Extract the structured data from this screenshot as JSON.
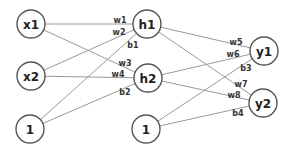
{
  "diagram": {
    "type": "neural-network",
    "colors": {
      "edge": "#9a9a9a",
      "node_stroke": "#555555",
      "text": "#222222",
      "background": "#ffffff"
    },
    "node_radius": 14,
    "nodes": [
      {
        "id": "x1",
        "label": "x1",
        "x": 31,
        "y": 24,
        "layer": "input"
      },
      {
        "id": "x2",
        "label": "x2",
        "x": 31,
        "y": 76,
        "layer": "input"
      },
      {
        "id": "b_in",
        "label": "1",
        "x": 30,
        "y": 129,
        "layer": "input-bias"
      },
      {
        "id": "h1",
        "label": "h1",
        "x": 147,
        "y": 24,
        "layer": "hidden"
      },
      {
        "id": "h2",
        "label": "h2",
        "x": 148,
        "y": 78,
        "layer": "hidden"
      },
      {
        "id": "b_hid",
        "label": "1",
        "x": 146,
        "y": 129,
        "layer": "hidden-bias"
      },
      {
        "id": "y1",
        "label": "y1",
        "x": 264,
        "y": 51,
        "layer": "output"
      },
      {
        "id": "y2",
        "label": "y2",
        "x": 263,
        "y": 103,
        "layer": "output"
      }
    ],
    "edges": [
      {
        "from": "x1",
        "to": "h1",
        "label": "w1",
        "lx": 120,
        "ly": 20
      },
      {
        "from": "x2",
        "to": "h1",
        "label": "w2",
        "lx": 119,
        "ly": 32
      },
      {
        "from": "b_in",
        "to": "h1",
        "label": "b1",
        "lx": 133,
        "ly": 45
      },
      {
        "from": "x1",
        "to": "h2",
        "label": "w3",
        "lx": 125,
        "ly": 63
      },
      {
        "from": "x2",
        "to": "h2",
        "label": "w4",
        "lx": 118,
        "ly": 74
      },
      {
        "from": "b_in",
        "to": "h2",
        "label": "b2",
        "lx": 125,
        "ly": 92
      },
      {
        "from": "h1",
        "to": "y1",
        "label": "w5",
        "lx": 236,
        "ly": 42
      },
      {
        "from": "h2",
        "to": "y1",
        "label": "w6",
        "lx": 233,
        "ly": 54
      },
      {
        "from": "b_hid",
        "to": "y1",
        "label": "b3",
        "lx": 246,
        "ly": 68
      },
      {
        "from": "h1",
        "to": "y2",
        "label": "w7",
        "lx": 241,
        "ly": 84
      },
      {
        "from": "h2",
        "to": "y2",
        "label": "w8",
        "lx": 234,
        "ly": 95
      },
      {
        "from": "b_hid",
        "to": "y2",
        "label": "b4",
        "lx": 238,
        "ly": 113
      }
    ]
  }
}
